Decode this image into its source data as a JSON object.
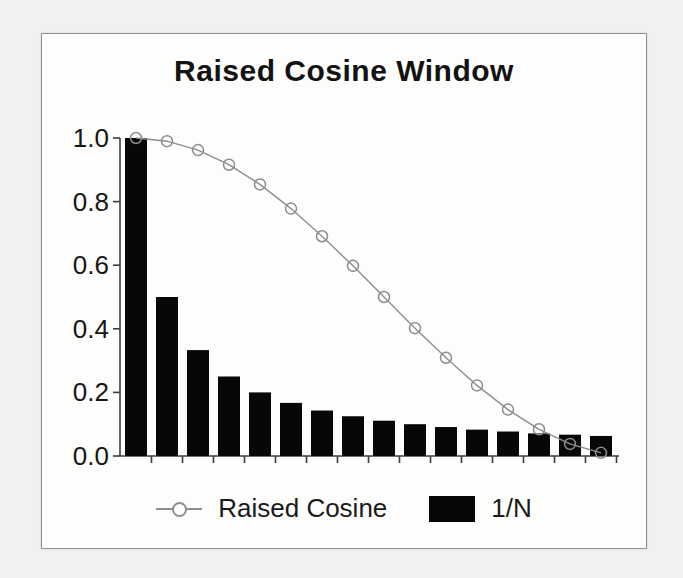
{
  "chart_data": {
    "type": "bar",
    "subtype": "bar-and-line-combo",
    "title": "Raised Cosine Window",
    "xlabel": "",
    "ylabel": "",
    "x": [
      1,
      2,
      3,
      4,
      5,
      6,
      7,
      8,
      9,
      10,
      11,
      12,
      13,
      14,
      15,
      16
    ],
    "series": [
      {
        "name": "Raised Cosine",
        "type": "line",
        "marker": "open-circle",
        "color": "#8d8d8d",
        "values": [
          1.0,
          0.99,
          0.962,
          0.916,
          0.854,
          0.778,
          0.691,
          0.598,
          0.5,
          0.402,
          0.309,
          0.222,
          0.146,
          0.084,
          0.038,
          0.01
        ]
      },
      {
        "name": "1/N",
        "type": "bar",
        "color": "#070707",
        "values": [
          1.0,
          0.5,
          0.333,
          0.25,
          0.2,
          0.167,
          0.143,
          0.125,
          0.111,
          0.1,
          0.091,
          0.083,
          0.077,
          0.071,
          0.067,
          0.063
        ]
      }
    ],
    "yticks": [
      "1.0",
      "0.8",
      "0.6",
      "0.4",
      "0.2",
      "0.0"
    ],
    "ytick_values": [
      1.0,
      0.8,
      0.6,
      0.4,
      0.2,
      0.0
    ],
    "ylim": [
      0,
      1.0
    ],
    "xtick_labels": [],
    "grid": false,
    "legend_position": "bottom",
    "axis_color": "#3c3c3c",
    "text_color": "#161616",
    "background_color": "#fdfdfc"
  },
  "legend": {
    "items": [
      {
        "label": "Raised Cosine",
        "swatch": "line-with-circle-marker"
      },
      {
        "label": "1/N",
        "swatch": "filled-black-rectangle"
      }
    ]
  }
}
